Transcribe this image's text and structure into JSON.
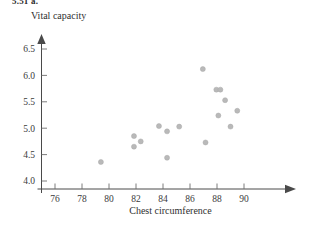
{
  "header": {
    "exercise_label": "5.51 a."
  },
  "chart_data": {
    "type": "scatter",
    "title": "",
    "xlabel": "Chest circumference",
    "ylabel": "Vital capacity",
    "xlim": [
      74.6,
      91.8
    ],
    "ylim": [
      3.92,
      6.72
    ],
    "xticks": [
      76,
      78,
      80,
      82,
      84,
      86,
      88,
      90
    ],
    "yticks": [
      "4.0",
      "4.5",
      "5.0",
      "5.5",
      "6.0",
      "6.5"
    ],
    "ytick_values": [
      4.0,
      4.5,
      5.0,
      5.5,
      6.0,
      6.5
    ],
    "grid": false,
    "legend": false,
    "marker_color": "#b9b9b9",
    "axis_color": "#4a4a4a",
    "points": [
      {
        "x": 79.4,
        "y": 4.36
      },
      {
        "x": 81.85,
        "y": 4.85
      },
      {
        "x": 81.85,
        "y": 4.65
      },
      {
        "x": 82.35,
        "y": 4.75
      },
      {
        "x": 83.7,
        "y": 5.04
      },
      {
        "x": 84.3,
        "y": 4.94
      },
      {
        "x": 84.3,
        "y": 4.44
      },
      {
        "x": 85.2,
        "y": 5.03
      },
      {
        "x": 86.95,
        "y": 6.12
      },
      {
        "x": 87.15,
        "y": 4.73
      },
      {
        "x": 87.95,
        "y": 5.73
      },
      {
        "x": 88.25,
        "y": 5.73
      },
      {
        "x": 88.1,
        "y": 5.24
      },
      {
        "x": 88.6,
        "y": 5.53
      },
      {
        "x": 89.0,
        "y": 5.03
      },
      {
        "x": 89.5,
        "y": 5.33
      }
    ]
  }
}
